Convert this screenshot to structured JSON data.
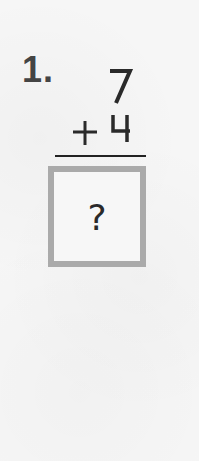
{
  "worksheet": {
    "problem": {
      "number_label": "1.",
      "addend_top": "7",
      "operator": "+",
      "addend_bottom": "4",
      "answer_placeholder": "?"
    },
    "colors": {
      "background": "#f6f6f6",
      "ink": "#2a2a2a",
      "box_border": "#aaaaaa"
    }
  }
}
